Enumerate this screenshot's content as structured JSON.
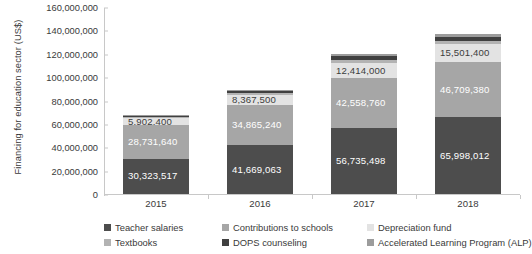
{
  "axis": {
    "y_title": "Financing for education sector (US$)",
    "y_ticks": [
      "0",
      "20,000,000",
      "40,000,000",
      "60,000,000",
      "80,000,000",
      "100,000,000",
      "120,000,000",
      "140,000,000",
      "160,000,000"
    ],
    "x_ticks": [
      "2015",
      "2016",
      "2017",
      "2018"
    ]
  },
  "legend": {
    "items": [
      {
        "label": "Teacher salaries",
        "color": "#4d4d4d"
      },
      {
        "label": "Contributions to schools",
        "color": "#a6a6a6"
      },
      {
        "label": "Depreciation fund",
        "color": "#e3e3e3"
      },
      {
        "label": "Textbooks",
        "color": "#b3b3b3"
      },
      {
        "label": "DOPS counseling",
        "color": "#404040"
      },
      {
        "label": "Accelerated Learning Program (ALP)",
        "color": "#9c9c9c"
      }
    ]
  },
  "chart_data": {
    "type": "bar",
    "subtype": "stacked-bar",
    "title": "",
    "xlabel": "",
    "ylabel": "Financing for education sector (US$)",
    "ylim": [
      0,
      160000000
    ],
    "ytick_step": 20000000,
    "grid": false,
    "legend_position": "bottom",
    "categories": [
      "2015",
      "2016",
      "2017",
      "2018"
    ],
    "series": [
      {
        "name": "Teacher salaries",
        "color": "#4d4d4d",
        "values": [
          30323517,
          41669063,
          56735498,
          65998012
        ],
        "labels": [
          "30,323,517",
          "41,669,063",
          "56,735,498",
          "65,998,012"
        ],
        "label_color": "#ffffff"
      },
      {
        "name": "Contributions to schools",
        "color": "#a6a6a6",
        "values": [
          28731640,
          34865240,
          42558760,
          46709380
        ],
        "labels": [
          "28,731,640",
          "34,865,240",
          "42,558,760",
          "46,709,380"
        ],
        "label_color": "#ffffff"
      },
      {
        "name": "Depreciation fund",
        "color": "#e3e3e3",
        "values": [
          5902400,
          8367500,
          12414000,
          15501400
        ],
        "labels": [
          "5,902,400",
          "8,367,500",
          "12,414,000",
          "15,501,400"
        ],
        "label_color": "#3c3c3c"
      },
      {
        "name": "Textbooks",
        "color": "#b3b3b3",
        "values": [
          1000000,
          1400000,
          2600000,
          2700000
        ],
        "labels": [
          "",
          "",
          "",
          ""
        ],
        "label_color": "#ffffff"
      },
      {
        "name": "DOPS counseling",
        "color": "#404040",
        "values": [
          1200000,
          1600000,
          3400000,
          3500000
        ],
        "labels": [
          "",
          "",
          "",
          ""
        ],
        "label_color": "#ffffff"
      },
      {
        "name": "Accelerated Learning Program (ALP)",
        "color": "#9c9c9c",
        "values": [
          900000,
          1100000,
          2200000,
          2300000
        ],
        "labels": [
          "",
          "",
          "",
          ""
        ],
        "label_color": "#ffffff"
      }
    ],
    "totals": [
      68059057,
      89002803,
      119908258,
      136711792
    ]
  }
}
